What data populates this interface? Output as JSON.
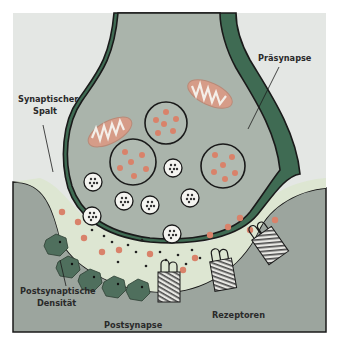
{
  "diagram": {
    "title": "Synapse",
    "labels": {
      "presynapse": "Präsynapse",
      "synaptic_cleft_line1": "Synaptischer",
      "synaptic_cleft_line2": "Spalt",
      "psd_line1": "Postsynaptische",
      "psd_line2": "Densität",
      "postsynapse": "Postsynapse",
      "receptors": "Rezeptoren"
    },
    "colors": {
      "background_panel": "#e3e6e3",
      "presynapse_fill": "#a9b3aa",
      "presynapse_inner": "#b8c2b9",
      "outer_membrane_band": "#3e6b52",
      "synaptic_cleft": "#dfe7d4",
      "postsynapse_fill": "#9ea6a0",
      "vesicle_dot": "#d9826a",
      "mitochondrion": "#d99b86",
      "psd_protein": "#4d6e5c",
      "outline": "#1a1a1a"
    }
  }
}
